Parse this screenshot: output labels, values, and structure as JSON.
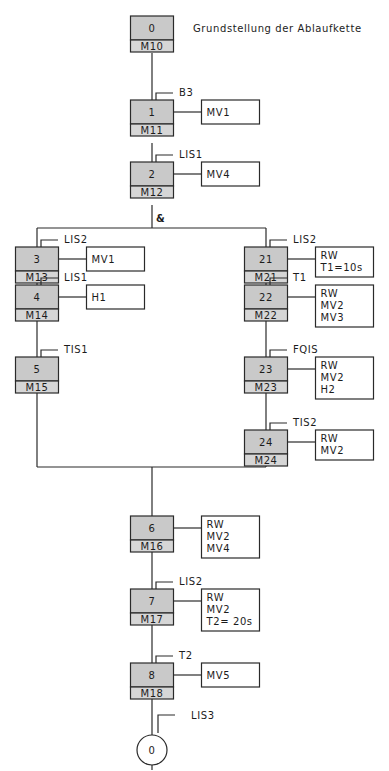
{
  "title_partial": "Ablaufkettenbeschreibung",
  "initial_step": {
    "number": "0",
    "marker": "M10",
    "comment": "Grundstellung der Ablaufkette"
  },
  "steps": [
    {
      "id": "s1",
      "number": "1",
      "marker": "M11",
      "transition": "B3",
      "actions": [
        "MV1"
      ]
    },
    {
      "id": "s2",
      "number": "2",
      "marker": "M12",
      "transition": "LIS1",
      "actions": [
        "MV4"
      ]
    },
    {
      "id": "s3",
      "number": "3",
      "marker": "M13",
      "transition": "LIS2",
      "actions": [
        "MV1"
      ]
    },
    {
      "id": "s4",
      "number": "4",
      "marker": "M14",
      "transition": "LIS1",
      "actions": [
        "H1"
      ]
    },
    {
      "id": "s5",
      "number": "5",
      "marker": "M15",
      "transition": "TIS1",
      "actions": []
    },
    {
      "id": "s21",
      "number": "21",
      "marker": "M21",
      "transition": "LIS2",
      "actions": [
        "RW",
        "T1=10s"
      ]
    },
    {
      "id": "s22",
      "number": "22",
      "marker": "M22",
      "transition": "T1",
      "actions": [
        "RW",
        "MV2",
        "MV3"
      ]
    },
    {
      "id": "s23",
      "number": "23",
      "marker": "M23",
      "transition": "FQIS",
      "actions": [
        "RW",
        "MV2",
        "H2"
      ]
    },
    {
      "id": "s24",
      "number": "24",
      "marker": "M24",
      "transition": "TIS2",
      "actions": [
        "RW",
        "MV2"
      ]
    },
    {
      "id": "s6",
      "number": "6",
      "marker": "M16",
      "transition": "",
      "actions": [
        "RW",
        "MV2",
        "MV4"
      ]
    },
    {
      "id": "s7",
      "number": "7",
      "marker": "M17",
      "transition": "LIS2",
      "actions": [
        "RW",
        "MV2",
        "T2= 20s"
      ]
    },
    {
      "id": "s8",
      "number": "8",
      "marker": "M18",
      "transition": "T2",
      "actions": [
        "MV5"
      ]
    }
  ],
  "branch_label": "&",
  "end": {
    "number": "0",
    "transition": "LIS3"
  }
}
